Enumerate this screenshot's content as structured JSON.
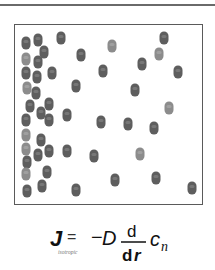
{
  "diagram": {
    "colors": {
      "particle_dark": "#5e5e5e",
      "particle_light": "#8c8c8c",
      "border": "#5a5a5a",
      "text": "#111111"
    },
    "particles": [
      {
        "x": 26,
        "y": 43,
        "shade": "dark"
      },
      {
        "x": 38,
        "y": 40,
        "shade": "dark"
      },
      {
        "x": 61,
        "y": 38,
        "shade": "dark"
      },
      {
        "x": 44,
        "y": 52,
        "shade": "dark"
      },
      {
        "x": 81,
        "y": 55,
        "shade": "dark"
      },
      {
        "x": 112,
        "y": 46,
        "shade": "light"
      },
      {
        "x": 164,
        "y": 38,
        "shade": "dark"
      },
      {
        "x": 159,
        "y": 54,
        "shade": "light"
      },
      {
        "x": 26,
        "y": 59,
        "shade": "light"
      },
      {
        "x": 38,
        "y": 62,
        "shade": "dark"
      },
      {
        "x": 142,
        "y": 64,
        "shade": "dark"
      },
      {
        "x": 178,
        "y": 72,
        "shade": "dark"
      },
      {
        "x": 26,
        "y": 73,
        "shade": "dark"
      },
      {
        "x": 37,
        "y": 77,
        "shade": "dark"
      },
      {
        "x": 52,
        "y": 73,
        "shade": "dark"
      },
      {
        "x": 103,
        "y": 71,
        "shade": "dark"
      },
      {
        "x": 76,
        "y": 86,
        "shade": "dark"
      },
      {
        "x": 135,
        "y": 90,
        "shade": "dark"
      },
      {
        "x": 27,
        "y": 88,
        "shade": "light"
      },
      {
        "x": 36,
        "y": 93,
        "shade": "dark"
      },
      {
        "x": 30,
        "y": 106,
        "shade": "dark"
      },
      {
        "x": 49,
        "y": 104,
        "shade": "dark"
      },
      {
        "x": 41,
        "y": 113,
        "shade": "dark"
      },
      {
        "x": 67,
        "y": 115,
        "shade": "dark"
      },
      {
        "x": 169,
        "y": 108,
        "shade": "light"
      },
      {
        "x": 26,
        "y": 120,
        "shade": "dark"
      },
      {
        "x": 49,
        "y": 120,
        "shade": "dark"
      },
      {
        "x": 101,
        "y": 122,
        "shade": "dark"
      },
      {
        "x": 128,
        "y": 124,
        "shade": "dark"
      },
      {
        "x": 154,
        "y": 128,
        "shade": "dark"
      },
      {
        "x": 26,
        "y": 135,
        "shade": "light"
      },
      {
        "x": 41,
        "y": 140,
        "shade": "dark"
      },
      {
        "x": 26,
        "y": 149,
        "shade": "light"
      },
      {
        "x": 38,
        "y": 155,
        "shade": "dark"
      },
      {
        "x": 49,
        "y": 151,
        "shade": "dark"
      },
      {
        "x": 67,
        "y": 151,
        "shade": "dark"
      },
      {
        "x": 94,
        "y": 156,
        "shade": "dark"
      },
      {
        "x": 140,
        "y": 154,
        "shade": "light"
      },
      {
        "x": 27,
        "y": 162,
        "shade": "dark"
      },
      {
        "x": 26,
        "y": 174,
        "shade": "light"
      },
      {
        "x": 47,
        "y": 172,
        "shade": "dark"
      },
      {
        "x": 115,
        "y": 180,
        "shade": "dark"
      },
      {
        "x": 156,
        "y": 178,
        "shade": "dark"
      },
      {
        "x": 27,
        "y": 191,
        "shade": "dark"
      },
      {
        "x": 42,
        "y": 186,
        "shade": "dark"
      },
      {
        "x": 76,
        "y": 190,
        "shade": "dark"
      },
      {
        "x": 192,
        "y": 188,
        "shade": "dark"
      }
    ]
  },
  "equation": {
    "flux_symbol": "J",
    "subscript": "isotropic",
    "equals": "=",
    "minus": "−",
    "coefficient": "D",
    "numerator": "d",
    "denominator_d": "d",
    "denominator_var": "r",
    "variable": "c",
    "variable_subscript": "n"
  }
}
